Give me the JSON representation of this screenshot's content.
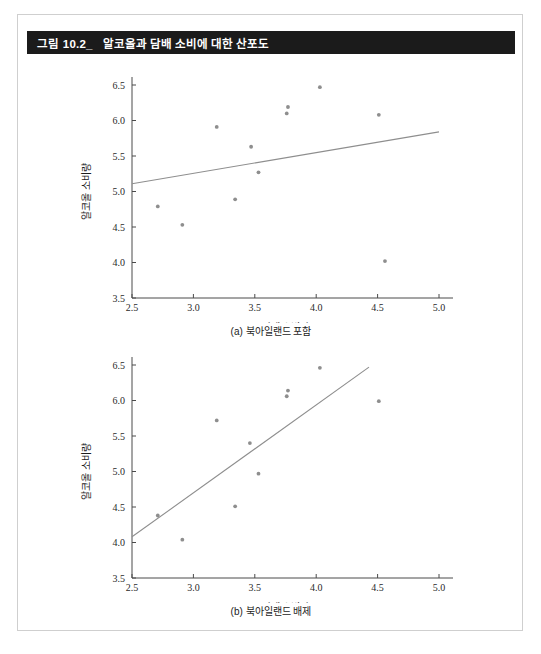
{
  "figure": {
    "number": "그림 10.2_",
    "title": "알코올과 담배 소비에 대한 산포도"
  },
  "chart_data": [
    {
      "id": "a",
      "type": "scatter",
      "title": "(a) 북아일랜드 포함",
      "xlabel": "담배 소비량",
      "ylabel": "알코올 소비량",
      "xlim": [
        2.5,
        5.0
      ],
      "ylim": [
        3.5,
        6.5
      ],
      "xticks": [
        "2.5",
        "3.0",
        "3.5",
        "4.0",
        "4.5",
        "5.0"
      ],
      "yticks": [
        "3.5",
        "4.0",
        "4.5",
        "5.0",
        "5.5",
        "6.0",
        "6.5"
      ],
      "grid": false,
      "legend": "none",
      "points": [
        {
          "x": 2.71,
          "y": 4.79
        },
        {
          "x": 2.91,
          "y": 4.53
        },
        {
          "x": 3.19,
          "y": 5.91
        },
        {
          "x": 3.34,
          "y": 4.89
        },
        {
          "x": 3.47,
          "y": 5.63
        },
        {
          "x": 3.53,
          "y": 5.27
        },
        {
          "x": 3.76,
          "y": 6.1
        },
        {
          "x": 3.77,
          "y": 6.19
        },
        {
          "x": 4.03,
          "y": 6.47
        },
        {
          "x": 4.51,
          "y": 6.08
        },
        {
          "x": 4.56,
          "y": 4.02
        }
      ],
      "fit_line": {
        "x0": 2.5,
        "y0": 5.11,
        "x1": 5.0,
        "y1": 5.84
      }
    },
    {
      "id": "b",
      "type": "scatter",
      "title": "(b) 북아일랜드 배제",
      "xlabel": "담배 소비량",
      "ylabel": "알코올 소비량",
      "xlim": [
        2.5,
        5.0
      ],
      "ylim": [
        3.5,
        6.5
      ],
      "xticks": [
        "2.5",
        "3.0",
        "3.5",
        "4.0",
        "4.5",
        "5.0"
      ],
      "yticks": [
        "3.5",
        "4.0",
        "4.5",
        "5.0",
        "5.5",
        "6.0",
        "6.5"
      ],
      "grid": false,
      "legend": "none",
      "points": [
        {
          "x": 2.71,
          "y": 4.38
        },
        {
          "x": 2.91,
          "y": 4.04
        },
        {
          "x": 3.19,
          "y": 5.72
        },
        {
          "x": 3.34,
          "y": 4.51
        },
        {
          "x": 3.46,
          "y": 5.4
        },
        {
          "x": 3.53,
          "y": 4.97
        },
        {
          "x": 3.76,
          "y": 6.06
        },
        {
          "x": 3.77,
          "y": 6.14
        },
        {
          "x": 4.03,
          "y": 6.46
        },
        {
          "x": 4.51,
          "y": 5.99
        }
      ],
      "fit_line": {
        "x0": 2.5,
        "y0": 4.08,
        "x1": 4.43,
        "y1": 6.47
      }
    }
  ]
}
